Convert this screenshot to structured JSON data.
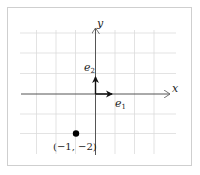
{
  "diagram": {
    "title": "",
    "axes": {
      "x_label": "x",
      "y_label": "y",
      "origin": [
        0,
        0
      ],
      "grid_range_x": [
        -4,
        4
      ],
      "grid_range_y": [
        -3,
        3
      ]
    },
    "vectors": [
      {
        "name": "e1",
        "label_base": "e",
        "label_sub": "1",
        "from": [
          0,
          0
        ],
        "to": [
          1,
          0
        ]
      },
      {
        "name": "e2",
        "label_base": "e",
        "label_sub": "2",
        "from": [
          0,
          0
        ],
        "to": [
          0,
          1
        ]
      }
    ],
    "points": [
      {
        "name": "point-neg1-neg2",
        "coords": [
          -1,
          -2
        ],
        "label": "(−1, −2)"
      }
    ],
    "colors": {
      "grid": "#d9d9d9",
      "axis": "#555555",
      "vector": "#111111",
      "point": "#000000",
      "frame": "#cfcfcf"
    }
  }
}
